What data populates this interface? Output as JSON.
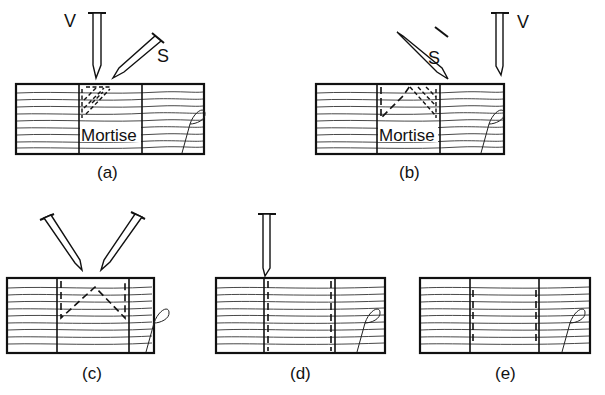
{
  "figure": {
    "panels": [
      {
        "id": "a",
        "caption": "(a)",
        "region_label": "Mortise",
        "tool_labels": [
          "V",
          "S"
        ]
      },
      {
        "id": "b",
        "caption": "(b)",
        "region_label": "Mortise",
        "tool_labels": [
          "S",
          "V"
        ]
      },
      {
        "id": "c",
        "caption": "(c)",
        "region_label": "",
        "tool_labels": []
      },
      {
        "id": "d",
        "caption": "(d)",
        "region_label": "",
        "tool_labels": []
      },
      {
        "id": "e",
        "caption": "(e)",
        "region_label": "",
        "tool_labels": []
      }
    ]
  }
}
